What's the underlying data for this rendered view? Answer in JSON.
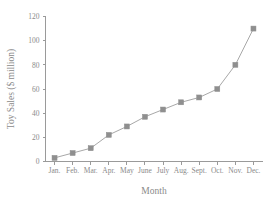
{
  "chart_data": {
    "type": "line",
    "title": "",
    "xlabel": "Month",
    "ylabel": "Toy Sales ($ million)",
    "categories": [
      "Jan.",
      "Feb.",
      "Mar.",
      "Apr.",
      "May",
      "June",
      "July",
      "Aug.",
      "Sept.",
      "Oct.",
      "Nov.",
      "Dec."
    ],
    "values": [
      3,
      7,
      11,
      22,
      29,
      37,
      43,
      49,
      53,
      60,
      80,
      110
    ],
    "ylim": [
      0,
      120
    ],
    "yticks": [
      0,
      20,
      40,
      60,
      80,
      100,
      120
    ],
    "ytick_labels": [
      "0",
      "20",
      "40",
      "60",
      "80",
      "100",
      "120"
    ],
    "grid": false,
    "legend": null,
    "marker": "square",
    "series_color": "#8f8f8f",
    "line_color": "#a8a8a8",
    "axis_color": "#9a9a9a",
    "text_color": "#8a8a8a",
    "background": "#ffffff"
  }
}
